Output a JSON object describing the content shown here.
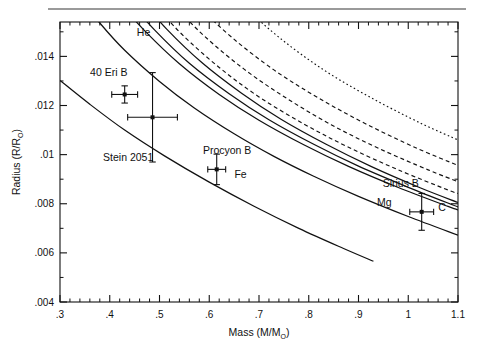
{
  "figure": {
    "background_color": "#ffffff",
    "rule_color": "#9a9a9a",
    "line_color": "#111111"
  },
  "chart_data": {
    "type": "line",
    "title": "",
    "xlabel_parts": {
      "main": "Mass (M/M",
      "sub": "O",
      "tail": ")"
    },
    "xlabel": "Mass (M/M☉)",
    "ylabel_parts": {
      "main": "Radius (R/R",
      "sub": "O",
      "tail": ")"
    },
    "ylabel": "Radius (R/R☉)",
    "xlim": [
      0.3,
      1.1
    ],
    "ylim": [
      0.004,
      0.0154
    ],
    "grid": false,
    "legend": "none",
    "xticks": [
      0.3,
      0.4,
      0.5,
      0.6,
      0.7,
      0.8,
      0.9,
      1.0,
      1.1
    ],
    "xticklabels": [
      ".3",
      ".4",
      ".5",
      ".6",
      ".7",
      ".8",
      ".9",
      "1",
      "1.1"
    ],
    "x_minor_per_major": 5,
    "yticks": [
      0.004,
      0.006,
      0.008,
      0.01,
      0.012,
      0.014
    ],
    "yticklabels": [
      ".004",
      ".006",
      ".008",
      ".01",
      ".012",
      ".014"
    ],
    "y_minor_per_major": 2,
    "annotations": [
      {
        "text": "He",
        "x": 0.468,
        "y": 0.01485,
        "name": "curve-label-he"
      },
      {
        "text": "Fe",
        "x": 0.663,
        "y": 0.00905,
        "name": "curve-label-fe"
      },
      {
        "text": "Mg",
        "x": 0.952,
        "y": 0.0079,
        "name": "curve-label-mg"
      },
      {
        "text": "C",
        "x": 1.068,
        "y": 0.00772,
        "name": "curve-label-c"
      },
      {
        "text": "40 Eri B",
        "x": 0.398,
        "y": 0.0132,
        "name": "point-label-40-eri-b"
      },
      {
        "text": "Stein 2051",
        "x": 0.437,
        "y": 0.00976,
        "name": "point-label-stein-2051"
      },
      {
        "text": "Procyon B",
        "x": 0.636,
        "y": 0.01002,
        "name": "point-label-procyon-b"
      },
      {
        "text": "Sirius B",
        "x": 0.985,
        "y": 0.00868,
        "name": "point-label-sirius-b"
      }
    ],
    "data_points": [
      {
        "label": "40 Eri B",
        "x": 0.43,
        "y": 0.01245,
        "xerr": 0.026,
        "yerr": 0.00035
      },
      {
        "label": "Stein 2051",
        "x": 0.486,
        "y": 0.01152,
        "xerr": 0.05,
        "yerr": 0.00182
      },
      {
        "label": "Procyon B",
        "x": 0.615,
        "y": 0.0094,
        "xerr": 0.018,
        "yerr": 0.00062
      },
      {
        "label": "Sirius B",
        "x": 1.027,
        "y": 0.00767,
        "xerr": 0.024,
        "yerr": 0.00075
      }
    ],
    "series": [
      {
        "name": "He",
        "style": "solid",
        "points": [
          [
            0.3,
            0.0176
          ],
          [
            0.34,
            0.0164
          ],
          [
            0.38,
            0.01536
          ],
          [
            0.43,
            0.01425
          ],
          [
            0.5,
            0.01298
          ],
          [
            0.57,
            0.0119
          ],
          [
            0.65,
            0.01085
          ],
          [
            0.73,
            0.00993
          ],
          [
            0.81,
            0.00912
          ],
          [
            0.9,
            0.0083
          ],
          [
            1.0,
            0.00748
          ],
          [
            1.1,
            0.00672
          ]
        ]
      },
      {
        "name": "C-solid-upper",
        "style": "solid",
        "points": [
          [
            0.37,
            0.0176
          ],
          [
            0.42,
            0.0162
          ],
          [
            0.47,
            0.01505
          ],
          [
            0.54,
            0.0137
          ],
          [
            0.62,
            0.01245
          ],
          [
            0.7,
            0.0114
          ],
          [
            0.79,
            0.0104
          ],
          [
            0.88,
            0.00952
          ],
          [
            0.98,
            0.00866
          ],
          [
            1.08,
            0.00789
          ],
          [
            1.1,
            0.00775
          ]
        ]
      },
      {
        "name": "C-solid-mid",
        "style": "solid",
        "points": [
          [
            0.392,
            0.0176
          ],
          [
            0.44,
            0.01625
          ],
          [
            0.49,
            0.01508
          ],
          [
            0.56,
            0.01372
          ],
          [
            0.64,
            0.01248
          ],
          [
            0.72,
            0.01142
          ],
          [
            0.81,
            0.01042
          ],
          [
            0.9,
            0.00953
          ],
          [
            1.0,
            0.00867
          ],
          [
            1.1,
            0.00787
          ]
        ]
      },
      {
        "name": "Mg-solid-lower",
        "style": "solid",
        "points": [
          [
            0.418,
            0.0176
          ],
          [
            0.465,
            0.01628
          ],
          [
            0.515,
            0.0151
          ],
          [
            0.585,
            0.01375
          ],
          [
            0.665,
            0.0125
          ],
          [
            0.745,
            0.01143
          ],
          [
            0.835,
            0.01042
          ],
          [
            0.925,
            0.00952
          ],
          [
            1.025,
            0.00864
          ],
          [
            1.1,
            0.00805
          ]
        ]
      },
      {
        "name": "dashed-1",
        "style": "dashed",
        "points": [
          [
            0.436,
            0.0176
          ],
          [
            0.49,
            0.01615
          ],
          [
            0.545,
            0.0149
          ],
          [
            0.62,
            0.01355
          ],
          [
            0.7,
            0.01235
          ],
          [
            0.79,
            0.01125
          ],
          [
            0.88,
            0.0103
          ],
          [
            0.98,
            0.00938
          ],
          [
            1.08,
            0.00856
          ],
          [
            1.1,
            0.00842
          ]
        ]
      },
      {
        "name": "dashed-2",
        "style": "dashed",
        "points": [
          [
            0.472,
            0.0176
          ],
          [
            0.53,
            0.0161
          ],
          [
            0.59,
            0.01483
          ],
          [
            0.67,
            0.01348
          ],
          [
            0.755,
            0.0123
          ],
          [
            0.845,
            0.01122
          ],
          [
            0.94,
            0.01026
          ],
          [
            1.04,
            0.00938
          ],
          [
            1.1,
            0.0089
          ]
        ]
      },
      {
        "name": "dashed-3",
        "style": "dashed",
        "points": [
          [
            0.514,
            0.0176
          ],
          [
            0.575,
            0.01613
          ],
          [
            0.645,
            0.01478
          ],
          [
            0.73,
            0.01345
          ],
          [
            0.82,
            0.0123
          ],
          [
            0.915,
            0.01125
          ],
          [
            1.015,
            0.01028
          ],
          [
            1.1,
            0.00956
          ]
        ]
      },
      {
        "name": "dotted-4",
        "style": "dotted",
        "points": [
          [
            0.6,
            0.0176
          ],
          [
            0.665,
            0.01615
          ],
          [
            0.74,
            0.01478
          ],
          [
            0.83,
            0.01345
          ],
          [
            0.925,
            0.01232
          ],
          [
            1.025,
            0.01128
          ],
          [
            1.1,
            0.0106
          ]
        ]
      },
      {
        "name": "Fe",
        "style": "solid",
        "points": [
          [
            0.3,
            0.01302
          ],
          [
            0.36,
            0.01205
          ],
          [
            0.43,
            0.011
          ],
          [
            0.51,
            0.00995
          ],
          [
            0.6,
            0.00888
          ],
          [
            0.69,
            0.0079
          ],
          [
            0.78,
            0.007
          ],
          [
            0.87,
            0.00618
          ],
          [
            0.93,
            0.00566
          ]
        ]
      }
    ]
  }
}
